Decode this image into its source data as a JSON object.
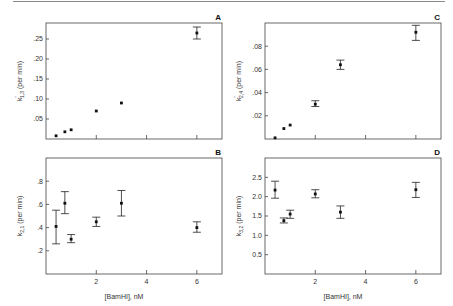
{
  "figure": {
    "x_axis_label": "[BamHI], nM",
    "x_tick_labels": [
      "2",
      "4",
      "6"
    ]
  },
  "chart_data": [
    {
      "panel": "A",
      "type": "scatter",
      "title": "",
      "xlabel": "",
      "ylabel": "k'1,3 (per min)",
      "ylabel_main": "k",
      "ylabel_sup": "'",
      "ylabel_sub": "1,3",
      "ylabel_unit": "(per min)",
      "xlim": [
        0,
        7
      ],
      "ylim": [
        0,
        0.29
      ],
      "y_ticks": [
        0.05,
        0.1,
        0.15,
        0.2,
        0.25
      ],
      "y_tick_labels": [
        ".05",
        ".10",
        ".15",
        ".20",
        ".25"
      ],
      "x_ticks": [
        2,
        4,
        6
      ],
      "x_tick_labels": [],
      "points": [
        {
          "x": 0.4,
          "y": 0.008
        },
        {
          "x": 0.75,
          "y": 0.018
        },
        {
          "x": 1.0,
          "y": 0.023
        },
        {
          "x": 2.0,
          "y": 0.07
        },
        {
          "x": 3.0,
          "y": 0.09
        },
        {
          "x": 6.0,
          "y": 0.265,
          "err_low": 0.25,
          "err_high": 0.28
        }
      ],
      "grid": false
    },
    {
      "panel": "B",
      "type": "scatter",
      "title": "",
      "xlabel": "[BamHI], nM",
      "ylabel": "k2,1 (per min)",
      "ylabel_main": "k",
      "ylabel_sup": "",
      "ylabel_sub": "2,1",
      "ylabel_unit": "(per min)",
      "xlim": [
        0,
        7
      ],
      "ylim": [
        0,
        1.0
      ],
      "y_ticks": [
        0.2,
        0.4,
        0.6,
        0.8
      ],
      "y_tick_labels": [
        ".2",
        ".4",
        ".6",
        ".8"
      ],
      "x_ticks": [
        2,
        4,
        6
      ],
      "x_tick_labels": [
        "2",
        "4",
        "6"
      ],
      "points": [
        {
          "x": 0.4,
          "y": 0.41,
          "err_low": 0.26,
          "err_high": 0.55
        },
        {
          "x": 0.75,
          "y": 0.61,
          "err_low": 0.52,
          "err_high": 0.71
        },
        {
          "x": 1.0,
          "y": 0.3,
          "err_low": 0.27,
          "err_high": 0.34
        },
        {
          "x": 2.0,
          "y": 0.45,
          "err_low": 0.41,
          "err_high": 0.49
        },
        {
          "x": 3.0,
          "y": 0.61,
          "err_low": 0.5,
          "err_high": 0.72
        },
        {
          "x": 6.0,
          "y": 0.4,
          "err_low": 0.36,
          "err_high": 0.45
        }
      ],
      "grid": false
    },
    {
      "panel": "C",
      "type": "scatter",
      "title": "",
      "xlabel": "",
      "ylabel": "k'2,4 (per min)",
      "ylabel_main": "k",
      "ylabel_sup": "'",
      "ylabel_sub": "2,4",
      "ylabel_unit": "(per min)",
      "xlim": [
        0,
        7
      ],
      "ylim": [
        0,
        0.1
      ],
      "y_ticks": [
        0.02,
        0.04,
        0.06,
        0.08
      ],
      "y_tick_labels": [
        ".02",
        ".04",
        ".06",
        ".08"
      ],
      "x_ticks": [
        2,
        4,
        6
      ],
      "x_tick_labels": [],
      "points": [
        {
          "x": 0.4,
          "y": 0.001
        },
        {
          "x": 0.75,
          "y": 0.009
        },
        {
          "x": 1.0,
          "y": 0.012
        },
        {
          "x": 2.0,
          "y": 0.03,
          "err_low": 0.028,
          "err_high": 0.033
        },
        {
          "x": 3.0,
          "y": 0.064,
          "err_low": 0.06,
          "err_high": 0.068
        },
        {
          "x": 6.0,
          "y": 0.092,
          "err_low": 0.085,
          "err_high": 0.098
        }
      ],
      "grid": false
    },
    {
      "panel": "D",
      "type": "scatter",
      "title": "",
      "xlabel": "[BamHI], nM",
      "ylabel": "k3,2 (per min)",
      "ylabel_main": "k",
      "ylabel_sup": "",
      "ylabel_sub": "3,2",
      "ylabel_unit": "(per min)",
      "xlim": [
        0,
        7
      ],
      "ylim": [
        0,
        3.0
      ],
      "y_ticks": [
        0.5,
        1.0,
        1.5,
        2.0,
        2.5
      ],
      "y_tick_labels": [
        "0.5",
        "1.0",
        "1.5",
        "2.0",
        "2.5"
      ],
      "x_ticks": [
        2,
        4,
        6
      ],
      "x_tick_labels": [
        "2",
        "4",
        "6"
      ],
      "points": [
        {
          "x": 0.4,
          "y": 2.17,
          "err_low": 1.96,
          "err_high": 2.4
        },
        {
          "x": 0.75,
          "y": 1.38,
          "err_low": 1.32,
          "err_high": 1.45
        },
        {
          "x": 1.0,
          "y": 1.55,
          "err_low": 1.44,
          "err_high": 1.65
        },
        {
          "x": 2.0,
          "y": 2.07,
          "err_low": 1.97,
          "err_high": 2.18
        },
        {
          "x": 3.0,
          "y": 1.6,
          "err_low": 1.44,
          "err_high": 1.76
        },
        {
          "x": 6.0,
          "y": 2.18,
          "err_low": 1.98,
          "err_high": 2.37
        }
      ],
      "grid": false
    }
  ]
}
